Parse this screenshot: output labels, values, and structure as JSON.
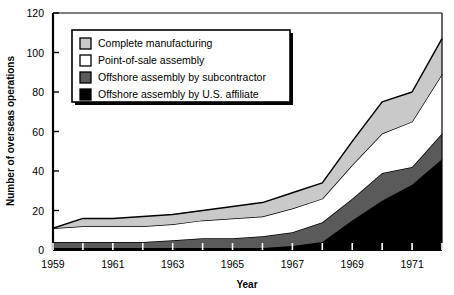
{
  "chart_data": {
    "type": "area",
    "stacked": true,
    "title": "",
    "xlabel": "Year",
    "ylabel": "Number of overseas operations",
    "x": [
      1959,
      1960,
      1961,
      1962,
      1963,
      1964,
      1965,
      1966,
      1967,
      1968,
      1969,
      1970,
      1971,
      1972
    ],
    "xlim": [
      1959,
      1972
    ],
    "ylim": [
      0,
      120
    ],
    "xticks": [
      1959,
      1960,
      1961,
      1962,
      1963,
      1964,
      1965,
      1966,
      1967,
      1968,
      1969,
      1970,
      1971,
      1972
    ],
    "xtick_labels": [
      "1959",
      "",
      "1961",
      "",
      "1963",
      "",
      "1965",
      "",
      "1967",
      "",
      "1969",
      "",
      "1971",
      ""
    ],
    "yticks": [
      0,
      20,
      40,
      60,
      80,
      100,
      120
    ],
    "ytick_labels": [
      "0",
      "20",
      "40",
      "60",
      "80",
      "100",
      "120"
    ],
    "grid": false,
    "legend_position": "upper-left-inside",
    "stack_order_bottom_to_top": [
      "Offshore assembly by U.S. affiliate",
      "Offshore assembly by subcontractor",
      "Point-of-sale assembly",
      "Complete manufacturing"
    ],
    "series": [
      {
        "name": "Offshore assembly by U.S. affiliate",
        "color": "#000000",
        "values": [
          1,
          1,
          1,
          1,
          1,
          1,
          1,
          1,
          2,
          4,
          15,
          25,
          33,
          46
        ]
      },
      {
        "name": "Offshore assembly by subcontractor",
        "color": "#5a5a5a",
        "values": [
          3,
          3,
          3,
          3,
          4,
          5,
          5,
          6,
          7,
          10,
          11,
          14,
          9,
          13
        ]
      },
      {
        "name": "Point-of-sale assembly",
        "color": "#ffffff",
        "values": [
          7,
          8,
          8,
          8,
          8,
          9,
          10,
          10,
          12,
          12,
          17,
          20,
          23,
          30
        ]
      },
      {
        "name": "Complete manufacturing",
        "color": "#c9c9c9",
        "values": [
          0,
          4,
          4,
          5,
          5,
          5,
          6,
          7,
          8,
          8,
          12,
          16,
          15,
          18
        ]
      }
    ],
    "cumulative_totals": [
      11,
      16,
      16,
      17,
      18,
      20,
      22,
      24,
      29,
      34,
      55,
      75,
      80,
      107
    ]
  },
  "legend": {
    "items": [
      {
        "label": "Complete manufacturing",
        "color": "#c9c9c9",
        "swatch": "legend-swatch-light-gray"
      },
      {
        "label": "Point-of-sale assembly",
        "color": "#ffffff",
        "swatch": "legend-swatch-white"
      },
      {
        "label": "Offshore assembly by subcontractor",
        "color": "#5a5a5a",
        "swatch": "legend-swatch-dark-gray"
      },
      {
        "label": "Offshore assembly by U.S. affiliate",
        "color": "#000000",
        "swatch": "legend-swatch-black"
      }
    ]
  },
  "colors": {
    "axis": "#000000",
    "background": "#ffffff",
    "series_light_gray": "#c9c9c9",
    "series_white": "#ffffff",
    "series_dark_gray": "#5a5a5a",
    "series_black": "#000000",
    "legend_border": "#000000",
    "legend_shadow": "#000000"
  }
}
